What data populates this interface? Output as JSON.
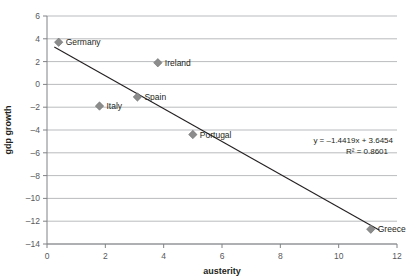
{
  "chart_data": {
    "type": "scatter",
    "title": "",
    "xlabel": "austerity",
    "ylabel": "gdp growth",
    "xlim": [
      0,
      12
    ],
    "ylim": [
      -14,
      6
    ],
    "xticks": [
      "0",
      "2",
      "4",
      "6",
      "8",
      "10",
      "12"
    ],
    "yticks": [
      "6",
      "4",
      "2",
      "0",
      "-2",
      "-4",
      "-6",
      "-8",
      "-10",
      "-12",
      "-14"
    ],
    "grid": "horizontal",
    "legend": "none",
    "points": [
      {
        "label": "Germany",
        "x": 0.4,
        "y": 3.7
      },
      {
        "label": "Italy",
        "x": 1.8,
        "y": -1.9
      },
      {
        "label": "Spain",
        "x": 3.1,
        "y": -1.1
      },
      {
        "label": "Ireland",
        "x": 3.8,
        "y": 1.9
      },
      {
        "label": "Portugal",
        "x": 5.0,
        "y": -4.4
      },
      {
        "label": "Greece",
        "x": 11.1,
        "y": -12.7
      }
    ],
    "trendline": {
      "slope": -1.4419,
      "intercept": 3.6454,
      "r_squared": 0.8601,
      "equation_text": "y = -1.4419x + 3.6454",
      "r2_text": "R² = 0.8601"
    },
    "colors": {
      "marker": "#8c8c8c",
      "trendline": "#231f20",
      "gridline": "#a7a9ac",
      "background": "#ffffff"
    }
  }
}
